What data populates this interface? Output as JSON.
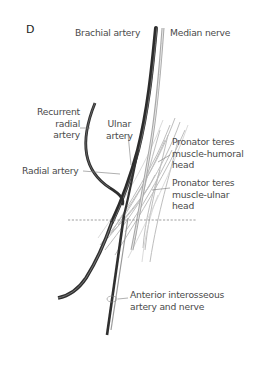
{
  "panel_letter": "D",
  "labels": {
    "brachial_artery": "Brachial artery",
    "median_nerve": "Median nerve",
    "recurrent_radial_artery": [
      "Recurrent",
      "radial",
      "artery"
    ],
    "ulnar_artery": [
      "Ulnar",
      "artery"
    ],
    "radial_artery": "Radial artery",
    "pronator_humoral": [
      "Pronator teres",
      "muscle-humoral",
      "head"
    ],
    "pronator_ulnar": [
      "Pronator teres",
      "muscle-ulnar",
      "head"
    ],
    "anterior_interosseous": [
      "Anterior interosseous",
      "artery and nerve"
    ]
  },
  "colors": {
    "vessel_dark": "#2b2b2b",
    "nerve_gray": "#9a9a9a",
    "muscle_gray": "#b5b5b5",
    "label_text": "#4a4a4a",
    "leader_line": "#7a7a7a"
  }
}
